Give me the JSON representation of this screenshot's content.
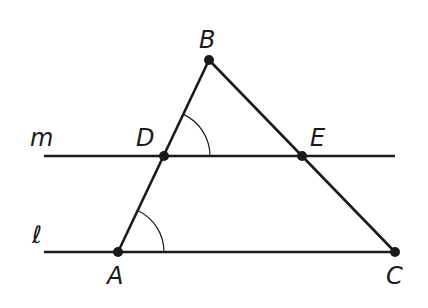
{
  "diagram": {
    "type": "geometry",
    "colors": {
      "stroke": "#1a1a1a",
      "background": "#ffffff"
    },
    "points": [
      {
        "id": "B",
        "label": "B",
        "x": 209,
        "y": 60,
        "label_x": 199,
        "label_y": 48
      },
      {
        "id": "D",
        "label": "D",
        "x": 164,
        "y": 156,
        "label_x": 136,
        "label_y": 146
      },
      {
        "id": "E",
        "label": "E",
        "x": 302,
        "y": 156,
        "label_x": 310,
        "label_y": 146
      },
      {
        "id": "A",
        "label": "A",
        "x": 118,
        "y": 252,
        "label_x": 107,
        "label_y": 284
      },
      {
        "id": "C",
        "label": "C",
        "x": 395,
        "y": 252,
        "label_x": 386,
        "label_y": 284
      }
    ],
    "lines": [
      {
        "id": "m",
        "label": "m",
        "x1": 44,
        "y1": 156,
        "x2": 395,
        "y2": 156,
        "label_x": 30,
        "label_y": 146
      },
      {
        "id": "l",
        "label": "ℓ",
        "x1": 44,
        "y1": 252,
        "x2": 395,
        "y2": 252,
        "label_x": 32,
        "label_y": 243
      }
    ],
    "segments": [
      {
        "from": "A",
        "to": "B"
      },
      {
        "from": "B",
        "to": "C"
      }
    ],
    "angle_marks": [
      {
        "vertex": "D",
        "between": [
          "E",
          "B"
        ],
        "radius": 46
      },
      {
        "vertex": "A",
        "between": [
          "C",
          "B"
        ],
        "radius": 46
      }
    ]
  }
}
